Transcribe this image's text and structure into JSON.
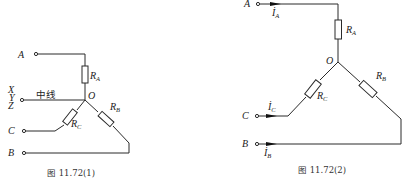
{
  "figures": [
    {
      "id": "fig1",
      "caption": "图 11.72(1)",
      "terminals": {
        "A": "A",
        "neutral_letters": [
          "X",
          "Y",
          "Z"
        ],
        "C": "C",
        "B": "B"
      },
      "neutral_label": "中线",
      "node_label": "O",
      "resistors": [
        {
          "name": "R",
          "sub": "A"
        },
        {
          "name": "R",
          "sub": "B"
        },
        {
          "name": "R",
          "sub": "C"
        }
      ]
    },
    {
      "id": "fig2",
      "caption": "图 11.72(2)",
      "terminals": {
        "A": "A",
        "C": "C",
        "B": "B"
      },
      "node_label": "O",
      "resistors": [
        {
          "name": "R",
          "sub": "A"
        },
        {
          "name": "R",
          "sub": "B"
        },
        {
          "name": "R",
          "sub": "C"
        }
      ],
      "currents": [
        {
          "name": "I",
          "sub": "A"
        },
        {
          "name": "I",
          "sub": "C"
        },
        {
          "name": "I",
          "sub": "B"
        }
      ]
    }
  ]
}
